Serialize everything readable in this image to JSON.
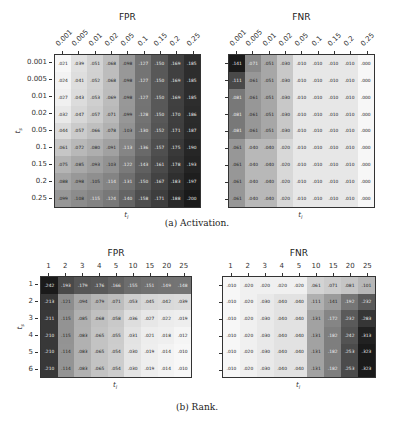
{
  "captions": {
    "a": "(a) Activation.",
    "b": "(b) Rank."
  },
  "colors": {
    "low": "#f7f7f7",
    "high": "#1a1a1a"
  },
  "chart_data": [
    {
      "type": "heatmap",
      "title": "FPR",
      "group": "Activation",
      "xlabel": "t_l",
      "ylabel": "t_s",
      "x": [
        "0.001",
        "0.005",
        "0.01",
        "0.02",
        "0.05",
        "0.1",
        "0.15",
        "0.2",
        "0.25"
      ],
      "y": [
        "0.001",
        "0.005",
        "0.01",
        "0.02",
        "0.05",
        "0.1",
        "0.15",
        "0.2",
        "0.25"
      ],
      "values": [
        [
          ".021",
          ".039",
          ".051",
          ".068",
          ".098",
          ".127",
          ".150",
          ".169",
          ".185"
        ],
        [
          ".024",
          ".041",
          ".052",
          ".068",
          ".098",
          ".127",
          ".150",
          ".169",
          ".185"
        ],
        [
          ".027",
          ".043",
          ".053",
          ".069",
          ".098",
          ".127",
          ".150",
          ".169",
          ".185"
        ],
        [
          ".032",
          ".047",
          ".057",
          ".071",
          ".099",
          ".128",
          ".150",
          ".170",
          ".186"
        ],
        [
          ".044",
          ".057",
          ".066",
          ".078",
          ".103",
          ".130",
          ".152",
          ".171",
          ".187"
        ],
        [
          ".061",
          ".072",
          ".080",
          ".091",
          ".113",
          ".136",
          ".157",
          ".175",
          ".190"
        ],
        [
          ".075",
          ".085",
          ".093",
          ".103",
          ".122",
          ".143",
          ".161",
          ".178",
          ".193"
        ],
        [
          ".088",
          ".098",
          ".105",
          ".114",
          ".131",
          ".150",
          ".167",
          ".183",
          ".197"
        ],
        [
          ".099",
          ".108",
          ".115",
          ".124",
          ".140",
          ".158",
          ".171",
          ".188",
          ".200"
        ]
      ]
    },
    {
      "type": "heatmap",
      "title": "FNR",
      "group": "Activation",
      "xlabel": "t_l",
      "ylabel": "",
      "x": [
        "0.001",
        "0.005",
        "0.01",
        "0.02",
        "0.05",
        "0.1",
        "0.15",
        "0.2",
        "0.25"
      ],
      "y": [
        "0.001",
        "0.005",
        "0.01",
        "0.02",
        "0.05",
        "0.1",
        "0.15",
        "0.2",
        "0.25"
      ],
      "values": [
        [
          ".141",
          ".071",
          ".051",
          ".030",
          ".010",
          ".010",
          ".010",
          ".010",
          ".000"
        ],
        [
          ".111",
          ".061",
          ".051",
          ".030",
          ".010",
          ".010",
          ".010",
          ".010",
          ".000"
        ],
        [
          ".081",
          ".061",
          ".051",
          ".030",
          ".010",
          ".010",
          ".010",
          ".010",
          ".000"
        ],
        [
          ".081",
          ".061",
          ".051",
          ".030",
          ".010",
          ".010",
          ".010",
          ".010",
          ".000"
        ],
        [
          ".081",
          ".061",
          ".051",
          ".030",
          ".010",
          ".010",
          ".010",
          ".010",
          ".000"
        ],
        [
          ".061",
          ".040",
          ".040",
          ".020",
          ".010",
          ".010",
          ".010",
          ".010",
          ".000"
        ],
        [
          ".061",
          ".040",
          ".040",
          ".020",
          ".010",
          ".010",
          ".010",
          ".010",
          ".000"
        ],
        [
          ".061",
          ".040",
          ".040",
          ".020",
          ".010",
          ".010",
          ".010",
          ".010",
          ".000"
        ],
        [
          ".061",
          ".040",
          ".040",
          ".020",
          ".010",
          ".010",
          ".010",
          ".010",
          ".000"
        ]
      ]
    },
    {
      "type": "heatmap",
      "title": "FPR",
      "group": "Rank",
      "xlabel": "t_l",
      "ylabel": "t_s",
      "x": [
        "1",
        "2",
        "3",
        "4",
        "5",
        "10",
        "15",
        "20",
        "25"
      ],
      "y": [
        "1",
        "2",
        "3",
        "4",
        "5",
        "6"
      ],
      "values": [
        [
          ".242",
          ".193",
          ".179",
          ".176",
          ".166",
          ".155",
          ".151",
          ".149",
          ".148"
        ],
        [
          ".213",
          ".121",
          ".094",
          ".079",
          ".071",
          ".053",
          ".045",
          ".042",
          ".039"
        ],
        [
          ".211",
          ".115",
          ".085",
          ".068",
          ".058",
          ".036",
          ".027",
          ".022",
          ".019"
        ],
        [
          ".210",
          ".115",
          ".083",
          ".065",
          ".055",
          ".031",
          ".021",
          ".018",
          ".012"
        ],
        [
          ".210",
          ".114",
          ".083",
          ".065",
          ".054",
          ".030",
          ".019",
          ".014",
          ".010"
        ],
        [
          ".210",
          ".114",
          ".083",
          ".065",
          ".054",
          ".030",
          ".019",
          ".014",
          ".010"
        ]
      ]
    },
    {
      "type": "heatmap",
      "title": "FNR",
      "group": "Rank",
      "xlabel": "t_l",
      "ylabel": "",
      "x": [
        "1",
        "2",
        "3",
        "4",
        "5",
        "10",
        "15",
        "20",
        "25"
      ],
      "y": [
        "1",
        "2",
        "3",
        "4",
        "5",
        "6"
      ],
      "values": [
        [
          ".010",
          ".020",
          ".020",
          ".020",
          ".020",
          ".061",
          ".071",
          ".081",
          ".101"
        ],
        [
          ".010",
          ".020",
          ".030",
          ".040",
          ".040",
          ".111",
          ".141",
          ".192",
          ".232"
        ],
        [
          ".010",
          ".020",
          ".030",
          ".040",
          ".040",
          ".131",
          ".172",
          ".232",
          ".283"
        ],
        [
          ".010",
          ".020",
          ".030",
          ".040",
          ".040",
          ".131",
          ".182",
          ".242",
          ".313"
        ],
        [
          ".010",
          ".020",
          ".030",
          ".040",
          ".040",
          ".131",
          ".182",
          ".253",
          ".323"
        ],
        [
          ".010",
          ".020",
          ".030",
          ".040",
          ".040",
          ".131",
          ".182",
          ".253",
          ".323"
        ]
      ]
    }
  ]
}
